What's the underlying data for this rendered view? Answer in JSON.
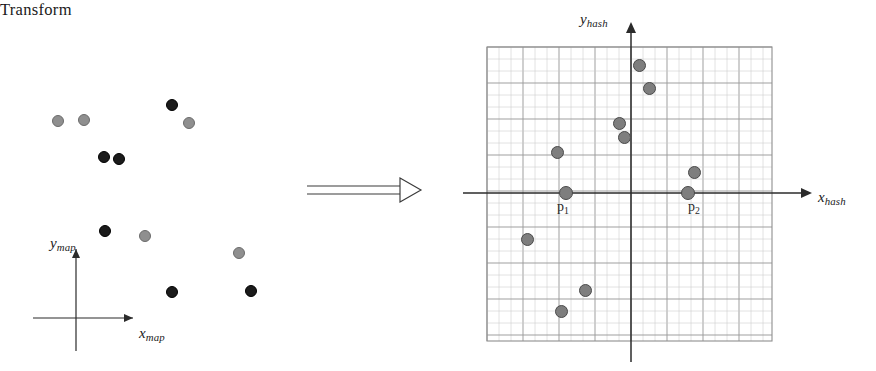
{
  "figure": {
    "width": 876,
    "height": 371,
    "background": "#ffffff",
    "caption_type": "diagram"
  },
  "colors": {
    "black_dot": "#1b1b1b",
    "gray_dot": "#8f8f8f",
    "hash_dot": "#7e7e7e",
    "axis": "#2b2b2b",
    "grid_major": "#9a9a9a",
    "grid_minor": "#c9c9c9",
    "text": "#1a1a1a"
  },
  "left_panel": {
    "name": "map-space-panel",
    "axes": {
      "x_label": "x",
      "x_subscript": "map",
      "y_label": "y",
      "y_subscript": "map",
      "origin_x": 76,
      "origin_y": 318,
      "x_axis_end": 138,
      "y_axis_top": 244
    },
    "points": [
      {
        "id": "m1",
        "x": 58,
        "y": 121,
        "color": "gray",
        "r": 6.0
      },
      {
        "id": "m2",
        "x": 84,
        "y": 120,
        "color": "gray",
        "r": 6.0
      },
      {
        "id": "m3",
        "x": 172,
        "y": 105,
        "color": "black",
        "r": 6.0
      },
      {
        "id": "m4",
        "x": 189,
        "y": 123,
        "color": "gray",
        "r": 6.0
      },
      {
        "id": "m5",
        "x": 104,
        "y": 157,
        "color": "black",
        "r": 6.0
      },
      {
        "id": "m6",
        "x": 119,
        "y": 159,
        "color": "black",
        "r": 6.0
      },
      {
        "id": "m7",
        "x": 105,
        "y": 231,
        "color": "black",
        "r": 6.0
      },
      {
        "id": "m8",
        "x": 145,
        "y": 236,
        "color": "gray",
        "r": 6.0
      },
      {
        "id": "m9",
        "x": 239,
        "y": 253,
        "color": "gray",
        "r": 6.0
      },
      {
        "id": "m10",
        "x": 172,
        "y": 292,
        "color": "black",
        "r": 6.0
      },
      {
        "id": "m11",
        "x": 251,
        "y": 291,
        "color": "black",
        "r": 6.0
      }
    ]
  },
  "transform": {
    "label": "Transform",
    "arrow_name": "double-line-arrow",
    "label_x": 315,
    "label_y": 158,
    "arrow_x1": 307,
    "arrow_x2": 420,
    "arrow_y": 190
  },
  "right_panel": {
    "name": "hash-space-panel",
    "grid": {
      "left": 487,
      "top": 47,
      "right": 772,
      "bottom": 341,
      "minor_step": 12.0,
      "major_every": 3,
      "visible": true
    },
    "axes": {
      "x_label": "x",
      "x_subscript": "hash",
      "y_label": "y",
      "y_subscript": "hash",
      "origin_x": 631,
      "origin_y": 193,
      "x_axis_start": 463,
      "x_axis_end": 812,
      "y_axis_top": 22,
      "y_axis_bottom": 362
    },
    "points": [
      {
        "id": "h1",
        "x": 639,
        "y": 65,
        "r": 6.5
      },
      {
        "id": "h2",
        "x": 649,
        "y": 88,
        "r": 6.5
      },
      {
        "id": "h3",
        "x": 619,
        "y": 123,
        "r": 6.5
      },
      {
        "id": "h4",
        "x": 624,
        "y": 137,
        "r": 6.5
      },
      {
        "id": "h5",
        "x": 557,
        "y": 152,
        "r": 6.5
      },
      {
        "id": "h6",
        "x": 694,
        "y": 172,
        "r": 6.5
      },
      {
        "id": "h7",
        "x": 566,
        "y": 193,
        "r": 7.0,
        "label": "p1"
      },
      {
        "id": "h8",
        "x": 688,
        "y": 193,
        "r": 7.0,
        "label": "p2"
      },
      {
        "id": "h9",
        "x": 527,
        "y": 239,
        "r": 6.5
      },
      {
        "id": "h10",
        "x": 585,
        "y": 290,
        "r": 6.5
      },
      {
        "id": "h11",
        "x": 561,
        "y": 311,
        "r": 6.5
      }
    ],
    "annotations": [
      {
        "id": "p1",
        "text": "p",
        "subscript": "1"
      },
      {
        "id": "p2",
        "text": "p",
        "subscript": "2"
      }
    ]
  }
}
